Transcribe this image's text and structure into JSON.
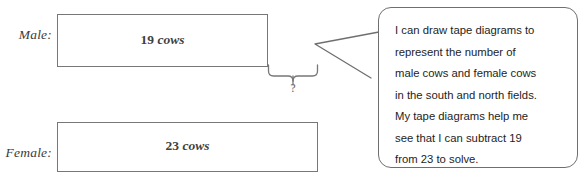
{
  "diagram": {
    "rows": [
      {
        "label": "Male:",
        "value": "19",
        "unit": "cows"
      },
      {
        "label": "Female:",
        "value": "23",
        "unit": "cows"
      }
    ],
    "unknown_marker": "?",
    "line_color": "#777777"
  },
  "speech_bubble": {
    "lines": [
      "I can draw tape diagrams to",
      "represent the number of",
      "male cows and female cows",
      "in the south and north fields.",
      "My tape diagrams help me",
      "see that I can subtract 19",
      "from 23 to solve."
    ],
    "border_color": "#6f6f6f"
  }
}
